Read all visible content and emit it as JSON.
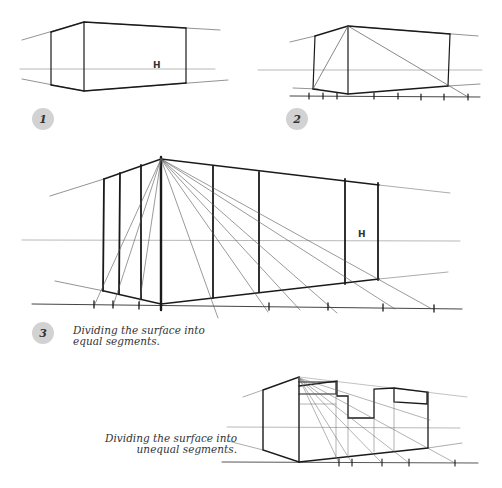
{
  "figures": [
    {
      "number": "1",
      "horizon_label": "H"
    },
    {
      "number": "2"
    },
    {
      "number": "3",
      "horizon_label": "H",
      "caption_line1": "Dividing the surface into",
      "caption_line2": "equal segments."
    },
    {
      "number": "",
      "caption_line1": "Dividing the surface into",
      "caption_line2": "unequal segments."
    }
  ],
  "colors": {
    "ink": "#1a1a1a",
    "guide": "#8a8a8a",
    "badge": "#d2d2d2"
  }
}
